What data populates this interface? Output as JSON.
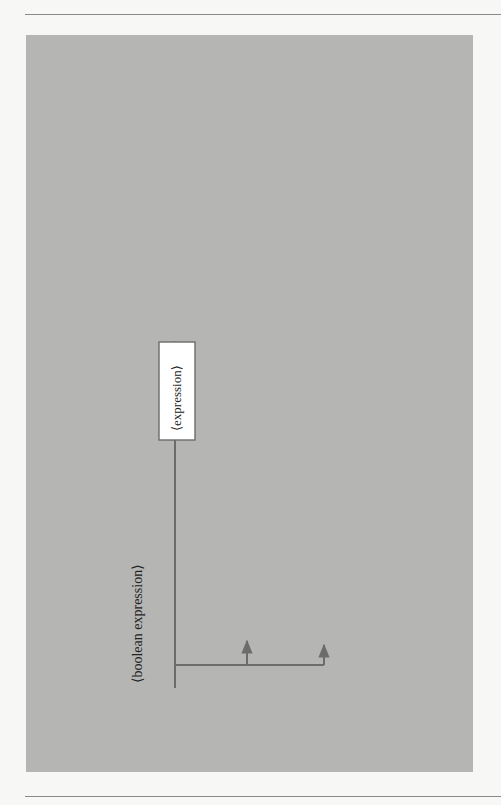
{
  "diagram": {
    "title": "⟨boolean expression⟩",
    "orientation": "rotated 90° counter-clockwise",
    "colors": {
      "panel": "#b5b5b3",
      "line": "#6c6c6c",
      "box": "#ffffff"
    },
    "rows": {
      "relational": {
        "left_expression": "⟨expression⟩",
        "operator": "⟨relational operator⟩",
        "right_expression": "⟨expression⟩"
      },
      "binary": {
        "open_paren_1": "(",
        "left_operand": [
          "⟨boolean",
          "expression⟩"
        ],
        "close_paren_1": ")",
        "operators": [
          "and",
          "or"
        ],
        "open_paren_2": "(",
        "right_operand": [
          "⟨boolean",
          "expression⟩"
        ],
        "close_paren_2": ")"
      },
      "negation": {
        "keyword": "not",
        "open_paren": "(",
        "operand": "⟨boolean expression⟩",
        "close_paren": ")"
      }
    }
  }
}
